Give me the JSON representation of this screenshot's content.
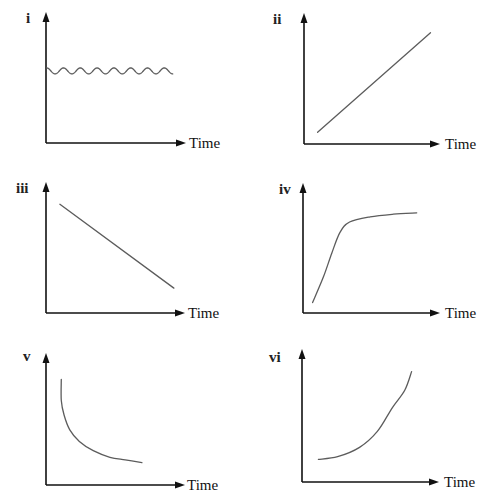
{
  "chart_data": [
    {
      "type": "line",
      "title": "i",
      "xlabel": "Time",
      "ylabel": "",
      "xlim": [
        0,
        10
      ],
      "ylim": [
        0,
        10
      ],
      "grid": false,
      "ticks": false,
      "shape": "small oscillation about a constant level",
      "series": [
        {
          "name": "i",
          "kind": "sine",
          "baseline": 5.5,
          "amplitude": 0.23,
          "cycles": 7.5,
          "x_start": 0.05,
          "x_end": 9.05
        }
      ]
    },
    {
      "type": "line",
      "title": "ii",
      "xlabel": "Time",
      "ylabel": "",
      "xlim": [
        0,
        10
      ],
      "ylim": [
        0,
        10
      ],
      "grid": false,
      "ticks": false,
      "shape": "straight line increasing",
      "series": [
        {
          "name": "ii",
          "kind": "line",
          "x": [
            1.0,
            9.3
          ],
          "y": [
            0.9,
            8.5
          ]
        }
      ]
    },
    {
      "type": "line",
      "title": "iii",
      "xlabel": "Time",
      "ylabel": "",
      "xlim": [
        0,
        10
      ],
      "ylim": [
        0,
        10
      ],
      "grid": false,
      "ticks": false,
      "shape": "straight line decreasing",
      "series": [
        {
          "name": "iii",
          "kind": "line",
          "x": [
            1.0,
            9.2
          ],
          "y": [
            8.3,
            1.9
          ]
        }
      ]
    },
    {
      "type": "line",
      "title": "iv",
      "xlabel": "Time",
      "ylabel": "",
      "xlim": [
        0,
        10
      ],
      "ylim": [
        0,
        10
      ],
      "grid": false,
      "ticks": false,
      "shape": "steep rise then levelling off (plateau)",
      "series": [
        {
          "name": "iv",
          "kind": "curve",
          "x": [
            0.7,
            1.5,
            2.1,
            2.7,
            3.4,
            4.9,
            6.6,
            8.3
          ],
          "y": [
            0.8,
            2.8,
            4.6,
            6.2,
            7.0,
            7.4,
            7.6,
            7.7
          ]
        }
      ]
    },
    {
      "type": "line",
      "title": "v",
      "xlabel": "Time",
      "ylabel": "",
      "xlim": [
        0,
        10
      ],
      "ylim": [
        0,
        10
      ],
      "grid": false,
      "ticks": false,
      "shape": "decreasing curve, flattening out",
      "series": [
        {
          "name": "v",
          "kind": "curve",
          "x": [
            1.1,
            1.1,
            1.3,
            1.7,
            2.4,
            3.4,
            4.6,
            5.7,
            6.9
          ],
          "y": [
            8.0,
            6.4,
            5.3,
            4.2,
            3.3,
            2.6,
            2.1,
            1.9,
            1.7
          ]
        }
      ]
    },
    {
      "type": "line",
      "title": "vi",
      "xlabel": "Time",
      "ylabel": "",
      "xlim": [
        0,
        10
      ],
      "ylim": [
        0,
        10
      ],
      "grid": false,
      "ticks": false,
      "shape": "increasing curve, getting steeper",
      "series": [
        {
          "name": "vi",
          "kind": "curve",
          "x": [
            1.2,
            2.6,
            4.2,
            5.5,
            6.6,
            7.5,
            8.0
          ],
          "y": [
            1.7,
            1.9,
            2.6,
            3.8,
            5.6,
            6.9,
            8.3
          ]
        }
      ]
    }
  ],
  "colors": {
    "axis": "#111111",
    "curve": "#5c5c5c",
    "background": "#ffffff"
  }
}
